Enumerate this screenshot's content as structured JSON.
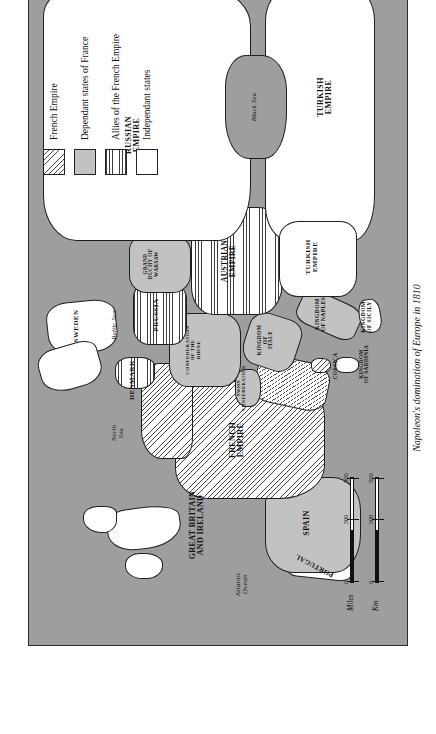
{
  "page": {
    "running_head": "Napoleonic Europe",
    "background": "#ffffff"
  },
  "caption": "Napoleon's domination of Europe in 1810",
  "legend": {
    "items": [
      {
        "key": "french-empire",
        "label": "French Empire",
        "pattern": "diagonal-hatch"
      },
      {
        "key": "dependant-states",
        "label": "Dependant states of France",
        "pattern": "solid-grey"
      },
      {
        "key": "allies",
        "label": "Allies of the French Empire",
        "pattern": "horizontal-lines"
      },
      {
        "key": "independant-states",
        "label": "Independant states",
        "pattern": "white"
      }
    ]
  },
  "scale": {
    "units": [
      {
        "name": "Miles",
        "min": "0",
        "mid": "300",
        "max": "500"
      },
      {
        "name": "Km",
        "min": "0",
        "mid": "300",
        "max": "500"
      }
    ],
    "miles_label": "Miles",
    "km_label": "Km",
    "zero": "0",
    "mid": "300",
    "max": "500"
  },
  "colors": {
    "sea": "#9e9e9e",
    "dependant": "#c2c2c2",
    "independant": "#ffffff",
    "outline": "#1e1e1e",
    "caption": "#1a1a1a"
  },
  "map": {
    "title": "Napoleon's domination of Europe in 1810",
    "territories": [
      {
        "name": "FRENCH\nEMPIRE",
        "category": "french-empire"
      },
      {
        "name": "SWISS\nCONFEDERATION",
        "category": "dependant-states"
      },
      {
        "name": "CONFEDERATION\nOF THE\nRHINE",
        "category": "dependant-states"
      },
      {
        "name": "KINGDOM\nOF\nITALY",
        "category": "dependant-states"
      },
      {
        "name": "KINGDOM\nOF NAPLES",
        "category": "dependant-states"
      },
      {
        "name": "SPAIN",
        "category": "dependant-states"
      },
      {
        "name": "GRAND\nDUCHY OF\nWARSAW",
        "category": "dependant-states"
      },
      {
        "name": "KINGDOM\nOF SICILY",
        "category": "independant-states"
      },
      {
        "name": "PORTUGAL",
        "category": "independant-states"
      },
      {
        "name": "GREAT BRITAIN\nAND IRELAND",
        "category": "independant-states"
      },
      {
        "name": "SWEDEN",
        "category": "independant-states"
      },
      {
        "name": "DENMARK",
        "category": "allies"
      },
      {
        "name": "PRUSSIA",
        "category": "allies"
      },
      {
        "name": "AUSTRIAN\nEMPIRE",
        "category": "allies"
      },
      {
        "name": "RUSSIAN\nEMPIRE",
        "category": "independant-states"
      },
      {
        "name": "TURKISH\nEMPIRE",
        "category": "independant-states"
      },
      {
        "name": "CORSICA",
        "category": "french-empire"
      },
      {
        "name": "KINGDOM\nOF SARDINIA",
        "category": "independant-states"
      }
    ],
    "water_labels": [
      {
        "name": "Atlantic\nOcean"
      },
      {
        "name": "North\nSea"
      },
      {
        "name": "Baltic Sea"
      },
      {
        "name": "Black Sea"
      }
    ]
  }
}
